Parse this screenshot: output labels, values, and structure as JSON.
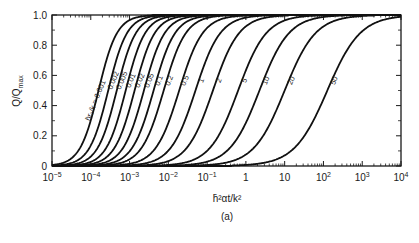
{
  "chart_data": {
    "type": "line",
    "title": "",
    "caption": "(a)",
    "xlabel": "h̄²αt/k²",
    "ylabel": "Q/Q_max",
    "xscale": "log",
    "xlim": [
      1e-05,
      10000.0
    ],
    "ylim": [
      0,
      1.0
    ],
    "x_tick_labels": [
      "10^-5",
      "10^-4",
      "10^-3",
      "10^-2",
      "10^-1",
      "1",
      "10",
      "10^2",
      "10^3",
      "10^4"
    ],
    "y_tick_labels": [
      "0",
      "0.2",
      "0.4",
      "0.6",
      "0.8",
      "1.0"
    ],
    "grid": false,
    "legend": "inline labels on curves",
    "parameter_label": "h̄r₀/k =",
    "series": [
      {
        "name": "0.001",
        "log10_x_at_half": -3.8,
        "spread": 0.55
      },
      {
        "name": "0.002",
        "log10_x_at_half": -3.55,
        "spread": 0.56
      },
      {
        "name": "0.005",
        "log10_x_at_half": -3.33,
        "spread": 0.57
      },
      {
        "name": "0.01",
        "log10_x_at_half": -3.1,
        "spread": 0.58
      },
      {
        "name": "0.02",
        "log10_x_at_half": -2.87,
        "spread": 0.6
      },
      {
        "name": "0.05",
        "log10_x_at_half": -2.63,
        "spread": 0.62
      },
      {
        "name": "0.1",
        "log10_x_at_half": -2.38,
        "spread": 0.64
      },
      {
        "name": "0.2",
        "log10_x_at_half": -2.12,
        "spread": 0.66
      },
      {
        "name": "0.5",
        "log10_x_at_half": -1.72,
        "spread": 0.7
      },
      {
        "name": "1",
        "log10_x_at_half": -1.3,
        "spread": 0.74
      },
      {
        "name": "2",
        "log10_x_at_half": -0.85,
        "spread": 0.78
      },
      {
        "name": "5",
        "log10_x_at_half": -0.2,
        "spread": 0.84
      },
      {
        "name": "10",
        "log10_x_at_half": 0.35,
        "spread": 0.88
      },
      {
        "name": "20",
        "log10_x_at_half": 1.0,
        "spread": 0.92
      },
      {
        "name": "50",
        "log10_x_at_half": 2.1,
        "spread": 0.98
      }
    ]
  }
}
